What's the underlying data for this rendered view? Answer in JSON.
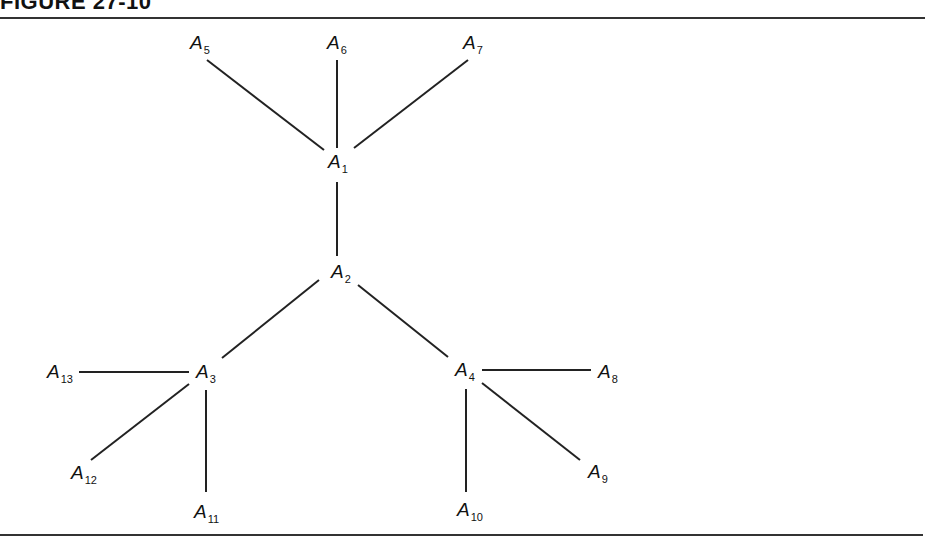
{
  "figure": {
    "title": "FIGURE 27-10"
  },
  "diagram": {
    "type": "tree",
    "line_color": "#222222",
    "nodes": [
      {
        "id": "A1",
        "letter": "A",
        "sub": "1"
      },
      {
        "id": "A2",
        "letter": "A",
        "sub": "2"
      },
      {
        "id": "A3",
        "letter": "A",
        "sub": "3"
      },
      {
        "id": "A4",
        "letter": "A",
        "sub": "4"
      },
      {
        "id": "A5",
        "letter": "A",
        "sub": "5"
      },
      {
        "id": "A6",
        "letter": "A",
        "sub": "6"
      },
      {
        "id": "A7",
        "letter": "A",
        "sub": "7"
      },
      {
        "id": "A8",
        "letter": "A",
        "sub": "8"
      },
      {
        "id": "A9",
        "letter": "A",
        "sub": "9"
      },
      {
        "id": "A10",
        "letter": "A",
        "sub": "10"
      },
      {
        "id": "A11",
        "letter": "A",
        "sub": "11"
      },
      {
        "id": "A12",
        "letter": "A",
        "sub": "12"
      },
      {
        "id": "A13",
        "letter": "A",
        "sub": "13"
      }
    ],
    "edges": [
      [
        "A1",
        "A5"
      ],
      [
        "A1",
        "A6"
      ],
      [
        "A1",
        "A7"
      ],
      [
        "A1",
        "A2"
      ],
      [
        "A2",
        "A3"
      ],
      [
        "A2",
        "A4"
      ],
      [
        "A3",
        "A13"
      ],
      [
        "A3",
        "A12"
      ],
      [
        "A3",
        "A11"
      ],
      [
        "A4",
        "A8"
      ],
      [
        "A4",
        "A9"
      ],
      [
        "A4",
        "A10"
      ]
    ]
  }
}
